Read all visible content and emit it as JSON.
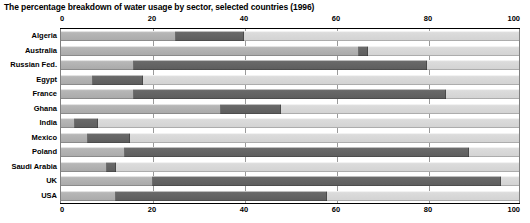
{
  "chart_data": {
    "type": "bar",
    "orientation": "horizontal",
    "stacked": true,
    "percent": true,
    "title": "The percentage breakdown of water usage by sector, selected countries (1996)",
    "xlabel": "",
    "ylabel": "",
    "xlim": [
      0,
      100
    ],
    "xticks": [
      0,
      20,
      40,
      60,
      80,
      100
    ],
    "xtick_labels": [
      "0",
      "20",
      "40",
      "60",
      "80",
      "100"
    ],
    "grid": true,
    "legend": null,
    "axis_top": true,
    "axis_bottom": true,
    "categories": [
      "Algeria",
      "Australia",
      "Russian Fed.",
      "Egypt",
      "France",
      "Ghana",
      "India",
      "Mexico",
      "Poland",
      "Saudi Arabia",
      "UK",
      "USA"
    ],
    "series": [
      {
        "name": "Domestic",
        "color": "#b0b0b0",
        "values": [
          25,
          65,
          16,
          7,
          16,
          35,
          3,
          6,
          14,
          10,
          20,
          12
        ]
      },
      {
        "name": "Industry",
        "color": "#636363",
        "values": [
          15,
          2,
          64,
          11,
          68,
          13,
          5,
          9,
          75,
          2,
          76,
          46
        ]
      },
      {
        "name": "Agriculture",
        "color": "#d8d8d8",
        "values": [
          60,
          33,
          20,
          82,
          16,
          52,
          92,
          85,
          11,
          88,
          4,
          42
        ]
      }
    ],
    "segment_boundaries": [
      {
        "country": "Algeria",
        "start": 25,
        "end": 40
      },
      {
        "country": "Australia",
        "start": 65,
        "end": 67
      },
      {
        "country": "Russian Fed.",
        "start": 16,
        "end": 80
      },
      {
        "country": "Egypt",
        "start": 7,
        "end": 18
      },
      {
        "country": "France",
        "start": 16,
        "end": 84
      },
      {
        "country": "Ghana",
        "start": 35,
        "end": 48
      },
      {
        "country": "India",
        "start": 3,
        "end": 8
      },
      {
        "country": "Mexico",
        "start": 6,
        "end": 15
      },
      {
        "country": "Poland",
        "start": 14,
        "end": 89
      },
      {
        "country": "Saudi Arabia",
        "start": 10,
        "end": 12
      },
      {
        "country": "UK",
        "start": 20,
        "end": 96
      },
      {
        "country": "USA",
        "start": 12,
        "end": 58
      }
    ]
  }
}
